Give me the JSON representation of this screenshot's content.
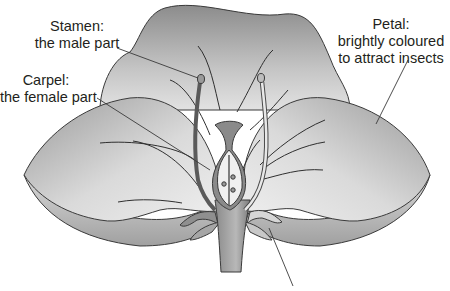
{
  "diagram": {
    "labels": {
      "stamen": {
        "name": "Stamen:",
        "description": "the male part"
      },
      "carpel": {
        "name": "Carpel:",
        "description": "the female part"
      },
      "petal": {
        "name": "Petal:",
        "line1": "brightly coloured",
        "line2": "to attract insects"
      }
    },
    "colors": {
      "petal_dark": "#8a8a8a",
      "petal_light": "#e6e6e6",
      "outline": "#3a3a3a",
      "text": "#231f20",
      "background": "#ffffff"
    }
  }
}
